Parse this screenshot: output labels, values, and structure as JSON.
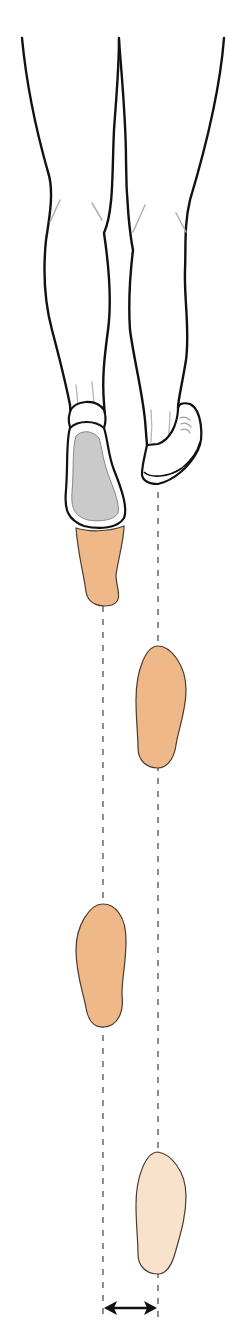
{
  "figure": {
    "title": "Step width in walking gait",
    "top_caption": "",
    "measurement_label": "Step width",
    "colors": {
      "outline": "#111111",
      "skin_footprint": "#efb888",
      "skin_footprint_faded": "#f8e2cc",
      "footprint_stroke": "#4a3a30",
      "sole_gray": "#c9c9c9",
      "crease_gray": "#a8a8a8",
      "dashed_line": "#444444",
      "background": "#ffffff"
    },
    "guide_lines": {
      "left_x": 103,
      "right_x": 158,
      "style": "dashed"
    },
    "footprints": [
      {
        "id": "left-1",
        "side": "left",
        "cx": 103,
        "top": 528,
        "bottom": 606,
        "opacity": "full"
      },
      {
        "id": "right-1",
        "side": "right",
        "cx": 158,
        "top": 646,
        "bottom": 768,
        "opacity": "full"
      },
      {
        "id": "left-2",
        "side": "left",
        "cx": 103,
        "top": 904,
        "bottom": 1027,
        "opacity": "full"
      },
      {
        "id": "right-2",
        "side": "right",
        "cx": 158,
        "top": 1152,
        "bottom": 1274,
        "opacity": "faded"
      }
    ],
    "arrow": {
      "x1": 103,
      "x2": 158,
      "y": 1308,
      "type": "double-headed"
    }
  }
}
